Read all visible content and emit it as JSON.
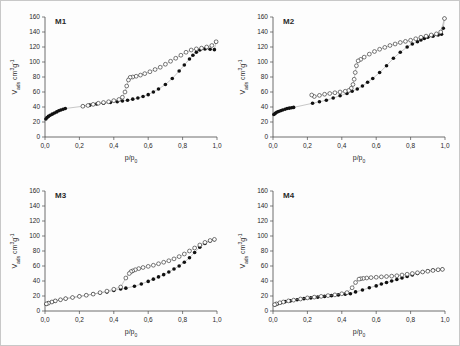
{
  "figure": {
    "background_color": "#fdfdfd",
    "border_color": "#c8c8c8",
    "adsorption_color": "#111111",
    "desorption_color": "#ffffff",
    "marker_edge_color": "#222222",
    "connector_color": "#9a9a9a"
  },
  "axes": {
    "xlabel": "p/p₀",
    "ylabel": "V ads  cm³g⁻¹",
    "ylabel_main": "V",
    "ylabel_sub": "ads",
    "ylabel_unit": "cm³g⁻¹",
    "xlim": [
      0.0,
      1.0
    ],
    "ylim": [
      0,
      160
    ],
    "xticks": [
      "0,0",
      "0,2",
      "0,4",
      "0,6",
      "0,8",
      "1,0"
    ],
    "xtick_values": [
      0.0,
      0.2,
      0.4,
      0.6,
      0.8,
      1.0
    ],
    "yticks": [
      "0",
      "20",
      "40",
      "60",
      "80",
      "100",
      "120",
      "140",
      "160"
    ],
    "ytick_values": [
      0,
      20,
      40,
      60,
      80,
      100,
      120,
      140,
      160
    ],
    "grid": false,
    "legend": "none"
  },
  "chart_data": [
    {
      "type": "scatter",
      "id": "M1",
      "title": "M1",
      "xlabel": "p/p₀",
      "ylabel": "V ads cm³g⁻¹",
      "xlim": [
        0.0,
        1.0
      ],
      "ylim": [
        0,
        160
      ],
      "series": [
        {
          "name": "adsorption",
          "marker": "filled-circle",
          "x": [
            0.005,
            0.012,
            0.02,
            0.03,
            0.042,
            0.055,
            0.068,
            0.08,
            0.092,
            0.105,
            0.118,
            0.22,
            0.26,
            0.3,
            0.34,
            0.38,
            0.42,
            0.45,
            0.48,
            0.51,
            0.54,
            0.57,
            0.6,
            0.63,
            0.66,
            0.7,
            0.74,
            0.78,
            0.81,
            0.84,
            0.86,
            0.88,
            0.9,
            0.93,
            0.96,
            0.985,
            0.995
          ],
          "y": [
            24.0,
            26.0,
            27.5,
            29.0,
            30.5,
            32.0,
            33.5,
            35.0,
            36.0,
            37.0,
            38.0,
            41.0,
            42.5,
            44.0,
            45.0,
            46.0,
            47.0,
            48.0,
            49.0,
            50.5,
            52.0,
            54.0,
            56.5,
            60.0,
            64.0,
            70.0,
            78.0,
            88.0,
            96.0,
            104.0,
            109.0,
            113.0,
            116.0,
            117.5,
            117.0,
            116.5,
            127.0
          ]
        },
        {
          "name": "desorption",
          "marker": "open-circle",
          "x": [
            0.995,
            0.97,
            0.94,
            0.91,
            0.88,
            0.85,
            0.82,
            0.79,
            0.76,
            0.73,
            0.7,
            0.67,
            0.64,
            0.61,
            0.58,
            0.555,
            0.53,
            0.51,
            0.495,
            0.485,
            0.475,
            0.465,
            0.45,
            0.43,
            0.4,
            0.37,
            0.34,
            0.31,
            0.28,
            0.25,
            0.22
          ],
          "y": [
            127.0,
            122.0,
            120.0,
            118.5,
            117.5,
            116.0,
            113.0,
            109.0,
            105.0,
            101.0,
            97.0,
            93.0,
            90.0,
            87.0,
            84.5,
            82.5,
            81.0,
            80.0,
            79.5,
            76.0,
            68.0,
            60.0,
            53.0,
            50.0,
            48.5,
            47.0,
            46.0,
            45.0,
            43.5,
            42.0,
            41.0
          ]
        }
      ]
    },
    {
      "type": "scatter",
      "id": "M2",
      "title": "M2",
      "xlabel": "p/p₀",
      "ylabel": "V ads cm³g⁻¹",
      "xlim": [
        0.0,
        1.0
      ],
      "ylim": [
        0,
        160
      ],
      "series": [
        {
          "name": "adsorption",
          "marker": "filled-circle",
          "x": [
            0.005,
            0.013,
            0.022,
            0.032,
            0.044,
            0.056,
            0.07,
            0.082,
            0.095,
            0.108,
            0.12,
            0.23,
            0.27,
            0.31,
            0.35,
            0.39,
            0.43,
            0.46,
            0.49,
            0.52,
            0.55,
            0.58,
            0.62,
            0.66,
            0.7,
            0.74,
            0.78,
            0.81,
            0.84,
            0.86,
            0.88,
            0.9,
            0.93,
            0.96,
            0.98,
            0.99,
            0.997
          ],
          "y": [
            30.0,
            31.5,
            33.0,
            34.0,
            35.0,
            36.0,
            37.0,
            38.0,
            38.5,
            39.0,
            39.5,
            45.0,
            47.0,
            49.0,
            52.0,
            55.0,
            58.0,
            61.0,
            64.0,
            68.0,
            73.0,
            78.0,
            86.0,
            95.0,
            105.0,
            113.0,
            120.0,
            124.0,
            127.0,
            129.5,
            131.5,
            133.0,
            134.5,
            136.0,
            137.0,
            145.0,
            158.0
          ]
        },
        {
          "name": "desorption",
          "marker": "open-circle",
          "x": [
            0.997,
            0.975,
            0.95,
            0.92,
            0.89,
            0.86,
            0.83,
            0.8,
            0.77,
            0.74,
            0.71,
            0.68,
            0.65,
            0.62,
            0.59,
            0.56,
            0.53,
            0.51,
            0.495,
            0.485,
            0.478,
            0.472,
            0.465,
            0.455,
            0.44,
            0.42,
            0.39,
            0.36,
            0.33,
            0.3,
            0.27,
            0.24,
            0.225
          ],
          "y": [
            158.0,
            140.0,
            137.5,
            136.0,
            134.5,
            133.0,
            131.0,
            129.0,
            127.5,
            126.0,
            124.0,
            122.0,
            119.5,
            117.0,
            114.0,
            110.5,
            106.5,
            103.5,
            101.5,
            95.0,
            86.0,
            77.0,
            70.0,
            65.0,
            62.0,
            61.0,
            60.0,
            59.0,
            58.0,
            57.0,
            55.5,
            54.0,
            56.0
          ]
        }
      ]
    },
    {
      "type": "scatter",
      "id": "M3",
      "title": "M3",
      "xlabel": "p/p₀",
      "ylabel": "V ads cm³g⁻¹",
      "xlim": [
        0.0,
        1.0
      ],
      "ylim": [
        0,
        160
      ],
      "series": [
        {
          "name": "adsorption",
          "marker": "filled-circle",
          "x": [
            0.008,
            0.02,
            0.04,
            0.06,
            0.09,
            0.12,
            0.16,
            0.2,
            0.24,
            0.28,
            0.32,
            0.36,
            0.4,
            0.44,
            0.47,
            0.52,
            0.56,
            0.6,
            0.63,
            0.66,
            0.69,
            0.72,
            0.75,
            0.78,
            0.81,
            0.84,
            0.87,
            0.9,
            0.93,
            0.96,
            0.985
          ],
          "y": [
            9.0,
            10.5,
            12.0,
            13.5,
            15.0,
            16.5,
            18.0,
            19.5,
            21.0,
            22.5,
            24.0,
            25.5,
            27.5,
            29.5,
            30.5,
            33.0,
            36.0,
            39.5,
            42.5,
            45.5,
            48.5,
            52.0,
            56.0,
            60.0,
            65.0,
            71.0,
            78.0,
            85.0,
            90.0,
            93.5,
            95.0
          ]
        },
        {
          "name": "desorption",
          "marker": "open-circle",
          "x": [
            0.985,
            0.96,
            0.93,
            0.9,
            0.87,
            0.84,
            0.81,
            0.78,
            0.75,
            0.72,
            0.69,
            0.66,
            0.63,
            0.6,
            0.57,
            0.545,
            0.525,
            0.51,
            0.5,
            0.49,
            0.47,
            0.44,
            0.4,
            0.36,
            0.32,
            0.28,
            0.24,
            0.2,
            0.16,
            0.12,
            0.09,
            0.06,
            0.04,
            0.02,
            0.008
          ],
          "y": [
            95.5,
            94.0,
            91.5,
            88.0,
            84.0,
            80.0,
            76.0,
            72.5,
            69.5,
            67.0,
            65.0,
            63.0,
            61.0,
            59.5,
            58.0,
            56.5,
            55.0,
            53.5,
            52.5,
            50.0,
            44.0,
            32.0,
            29.0,
            26.5,
            24.5,
            22.5,
            21.0,
            19.5,
            18.0,
            16.5,
            15.0,
            13.5,
            12.0,
            10.5,
            9.5
          ]
        }
      ]
    },
    {
      "type": "scatter",
      "id": "M4",
      "title": "M4",
      "xlabel": "p/p₀",
      "ylabel": "V ads cm³g⁻¹",
      "xlim": [
        0.0,
        1.0
      ],
      "ylim": [
        0,
        160
      ],
      "series": [
        {
          "name": "adsorption",
          "marker": "filled-circle",
          "x": [
            0.01,
            0.025,
            0.045,
            0.07,
            0.1,
            0.14,
            0.18,
            0.22,
            0.26,
            0.3,
            0.34,
            0.38,
            0.42,
            0.45,
            0.48,
            0.52,
            0.56,
            0.6,
            0.63,
            0.66,
            0.69,
            0.72,
            0.75,
            0.78,
            0.81,
            0.84,
            0.87,
            0.9,
            0.93,
            0.96,
            0.985
          ],
          "y": [
            8.0,
            9.5,
            11.0,
            12.5,
            13.5,
            15.0,
            16.5,
            17.5,
            18.5,
            19.5,
            20.5,
            21.5,
            22.5,
            23.0,
            25.5,
            28.0,
            31.0,
            33.5,
            36.0,
            38.0,
            40.0,
            42.0,
            44.0,
            46.0,
            48.0,
            50.0,
            52.0,
            53.5,
            54.5,
            55.0,
            55.5
          ]
        },
        {
          "name": "desorption",
          "marker": "open-circle",
          "x": [
            0.985,
            0.96,
            0.93,
            0.9,
            0.87,
            0.84,
            0.81,
            0.78,
            0.75,
            0.72,
            0.69,
            0.66,
            0.63,
            0.6,
            0.57,
            0.545,
            0.525,
            0.51,
            0.5,
            0.48,
            0.46,
            0.43,
            0.4,
            0.36,
            0.32,
            0.28,
            0.24,
            0.2,
            0.16,
            0.12,
            0.09,
            0.06,
            0.04,
            0.02,
            0.01
          ],
          "y": [
            55.5,
            55.0,
            54.0,
            53.0,
            52.0,
            51.0,
            50.0,
            49.0,
            48.0,
            47.0,
            46.5,
            46.0,
            45.5,
            45.0,
            44.5,
            44.0,
            43.5,
            43.0,
            42.5,
            38.0,
            31.0,
            24.5,
            23.0,
            21.5,
            20.5,
            19.5,
            18.5,
            17.5,
            16.0,
            14.5,
            13.5,
            12.0,
            11.0,
            9.5,
            8.5
          ]
        }
      ]
    }
  ]
}
